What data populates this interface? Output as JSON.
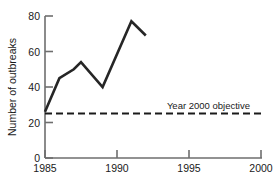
{
  "chart_data": {
    "type": "line",
    "title": "",
    "xlabel": "",
    "ylabel": "Number of outbreaks",
    "xlim": [
      1985,
      2000
    ],
    "ylim": [
      0,
      80
    ],
    "grid": false,
    "legend_position": "none",
    "xticks": [
      1985,
      1990,
      1995,
      2000
    ],
    "xtick_labels": [
      "1985",
      "1990",
      "1995",
      "2000"
    ],
    "yticks": [
      0,
      20,
      40,
      60,
      80
    ],
    "ytick_labels": [
      "0",
      "20",
      "40",
      "60",
      "80"
    ],
    "series": [
      {
        "name": "Number of outbreaks",
        "style": "solid",
        "color": "#262626",
        "x": [
          1985,
          1986,
          1987,
          1987.5,
          1989,
          1991,
          1992
        ],
        "values": [
          26,
          45,
          50,
          54,
          40,
          77,
          69
        ]
      }
    ],
    "reference_lines": [
      {
        "name": "Year 2000 objective",
        "style": "dashed",
        "color": "#1a1a1a",
        "value": 26,
        "x_start": 1985,
        "x_end": 2000,
        "label": "Year 2000 objective"
      }
    ],
    "annotations": [
      {
        "text": "Year 2000 objective",
        "x": 1992.3,
        "y": 30
      }
    ]
  },
  "labels": {
    "y_axis_title": "Number of outbreaks",
    "objective_note": "Year 2000 objective"
  }
}
